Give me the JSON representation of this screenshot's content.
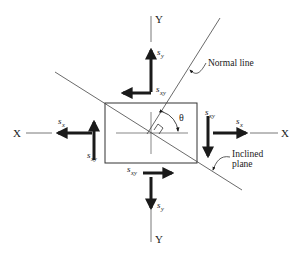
{
  "diagram": {
    "axes": {
      "x_left": "X",
      "x_right": "X",
      "y_top": "Y",
      "y_bottom": "Y"
    },
    "stresses": {
      "sy_top": {
        "base": "s",
        "sub": "y"
      },
      "sxy_top": {
        "base": "s",
        "sub": "xy"
      },
      "sx_left": {
        "base": "s",
        "sub": "x"
      },
      "sxy_left": {
        "base": "s",
        "sub": "xy"
      },
      "sxy_right": {
        "base": "s",
        "sub": "xy"
      },
      "sx_right": {
        "base": "s",
        "sub": "x"
      },
      "sxy_bottom": {
        "base": "s",
        "sub": "xy"
      },
      "sy_bottom": {
        "base": "s",
        "sub": "y"
      }
    },
    "angle_label": "θ",
    "annotations": {
      "normal_line": "Normal line",
      "inclined_plane_line1": "Inclined",
      "inclined_plane_line2": "plane"
    },
    "colors": {
      "ink": "#1a1a1a",
      "thin_line": "#555555",
      "background": "#ffffff"
    }
  }
}
